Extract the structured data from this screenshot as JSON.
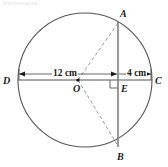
{
  "figure": {
    "title_artifact": "Mathematics",
    "shape": "circle-with-chord",
    "stroke_color": "#555555",
    "dash_color": "#8a8a8a",
    "text_color": "#1a1a1a",
    "background": "#ffffff"
  },
  "points": [
    {
      "id": "A",
      "label": "A",
      "x": 118,
      "y": 22,
      "label_x": 120,
      "label_y": 9
    },
    {
      "id": "B",
      "label": "B",
      "x": 118,
      "y": 147,
      "label_x": 117,
      "label_y": 152
    },
    {
      "id": "C",
      "label": "C",
      "x": 152,
      "y": 80,
      "label_x": 155,
      "label_y": 76
    },
    {
      "id": "D",
      "label": "D",
      "x": 18,
      "y": 80,
      "label_x": 3,
      "label_y": 76
    },
    {
      "id": "E",
      "label": "E",
      "x": 118,
      "y": 80,
      "label_x": 121,
      "label_y": 84
    },
    {
      "id": "O",
      "label": "O",
      "x": 78,
      "y": 80,
      "label_x": 73,
      "label_y": 84
    }
  ],
  "circle": {
    "center_x": 85,
    "center_y": 80,
    "radius": 67
  },
  "dimensions": [
    {
      "id": "dim-DE",
      "label": "12 cm",
      "from_x": 19,
      "to_x": 117,
      "y": 74,
      "label_x": 52,
      "label_y": 70
    },
    {
      "id": "dim-EC",
      "label": "4 cm",
      "from_x": 119,
      "to_x": 151,
      "y": 74,
      "label_x": 126,
      "label_y": 70
    }
  ],
  "segments": [
    {
      "id": "chord-AB",
      "style": "solid"
    },
    {
      "id": "diameter-DC",
      "style": "solid"
    },
    {
      "id": "radius-OA",
      "style": "dashed"
    },
    {
      "id": "radius-OB",
      "style": "dashed"
    }
  ],
  "marks": {
    "right_angle_at": "E",
    "center_dot_at": "O"
  }
}
